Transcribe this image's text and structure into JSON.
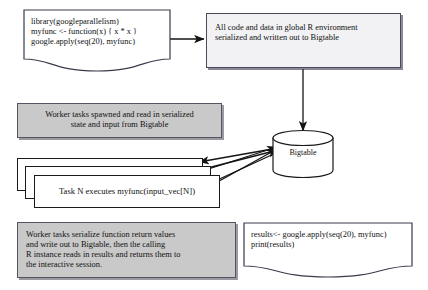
{
  "diagram": {
    "background_color": "#ffffff",
    "gray_fill": "#c9c9c9",
    "light_fill": "#f2f2f4",
    "line_color": "#1a1a1a"
  },
  "nodes": {
    "code_top": {
      "text": "library(googleparallelism)\nmyfunc <- function(x) { x * x }\ngoogle.apply(seq(20), myfunc)",
      "shape": "document"
    },
    "serialize_top": {
      "text": "All code and data in global R environment\nserialized and written out to Bigtable",
      "shape": "shadow-box"
    },
    "worker_spawn": {
      "text": "Worker tasks spawned and read in serialized\nstate and input from Bigtable",
      "shape": "gray-box"
    },
    "task_n": {
      "text": "Task N executes myfunc(input_vec[N])",
      "shape": "stacked-box",
      "stack_count": 3
    },
    "worker_return": {
      "text": "Worker tasks serialize function return values\nand write out to Bigtable, then the calling\nR instance reads in results and returns them to\nthe interactive session.",
      "shape": "gray-box"
    },
    "code_bottom": {
      "text": "results<- google.apply(seq(20), myfunc)\nprint(results)",
      "shape": "document"
    },
    "bigtable": {
      "label": "Bigtable",
      "shape": "cylinder"
    }
  },
  "arrows": [
    {
      "name": "code-to-serialize",
      "from": "code_top",
      "to": "serialize_top",
      "direction": "right"
    },
    {
      "name": "serialize-to-bigtable",
      "from": "serialize_top",
      "to": "bigtable",
      "direction": "down"
    },
    {
      "name": "bigtable-to-task-1",
      "from": "bigtable",
      "to": "task_n",
      "direction": "left"
    },
    {
      "name": "bigtable-to-task-2",
      "from": "bigtable",
      "to": "task_n",
      "direction": "left"
    },
    {
      "name": "bigtable-to-task-3",
      "from": "bigtable",
      "to": "task_n",
      "direction": "left"
    },
    {
      "name": "task-to-bigtable-1",
      "from": "task_n",
      "to": "bigtable",
      "direction": "right"
    },
    {
      "name": "task-to-bigtable-2",
      "from": "task_n",
      "to": "bigtable",
      "direction": "right"
    }
  ]
}
